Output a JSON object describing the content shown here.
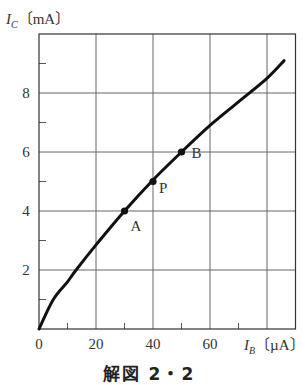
{
  "chart_data": {
    "type": "line",
    "title": "",
    "caption": "解図 2・2",
    "xlabel": "I_B (µA)",
    "ylabel": "I_C (mA)",
    "xlabel_parts": {
      "symbol": "I",
      "subscript": "B",
      "unit": "〔µA〕"
    },
    "ylabel_parts": {
      "symbol": "I",
      "subscript": "C",
      "unit": "〔mA〕"
    },
    "xlim": [
      0,
      90
    ],
    "ylim": [
      0,
      10
    ],
    "x_ticks": [
      0,
      20,
      40,
      60
    ],
    "x_tick_labels": [
      "0",
      "20",
      "40",
      "60"
    ],
    "x_minor_ticks": [
      10,
      30,
      50,
      70
    ],
    "x_gridlines": [
      20,
      40,
      60,
      80
    ],
    "y_ticks": [
      2,
      4,
      6,
      8
    ],
    "y_tick_labels": [
      "2",
      "4",
      "6",
      "8"
    ],
    "y_minor_ticks": [
      1,
      3,
      5,
      7,
      9
    ],
    "y_gridlines": [
      2,
      4,
      6,
      8
    ],
    "grid": true,
    "series": [
      {
        "name": "I_C vs I_B",
        "color": "#111111",
        "x": [
          0,
          5,
          10,
          13,
          20,
          30,
          40,
          50,
          60,
          70,
          80,
          86
        ],
        "y": [
          0,
          1.0,
          1.6,
          2.0,
          2.85,
          4.0,
          5.05,
          6.0,
          6.9,
          7.7,
          8.5,
          9.1
        ]
      }
    ],
    "annotations": [
      {
        "label": "A",
        "x": 30,
        "y": 4
      },
      {
        "label": "P",
        "x": 40,
        "y": 5
      },
      {
        "label": "B",
        "x": 50,
        "y": 6
      }
    ]
  }
}
